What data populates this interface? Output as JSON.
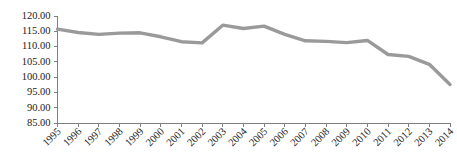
{
  "chart_data": {
    "type": "line",
    "title": "",
    "subtitle": "",
    "xlabel": "",
    "ylabel": "",
    "grid": false,
    "legend": false,
    "legend_position": "none",
    "line_color": "#9a9a9a",
    "axis_color": "#808080",
    "text_color": "#1a1a1a",
    "ylim": [
      85.0,
      120.0
    ],
    "ytick_step": 5.0,
    "ytick_labels": [
      "120.00",
      "115.00",
      "110.00",
      "105.00",
      "100.00",
      "95.00",
      "90.00",
      "85.00"
    ],
    "ytick_values": [
      120.0,
      115.0,
      110.0,
      105.0,
      100.0,
      95.0,
      90.0,
      85.0
    ],
    "categories": [
      "1995",
      "1996",
      "1997",
      "1998",
      "1999",
      "2000",
      "2001",
      "2002",
      "2003",
      "2004",
      "2005",
      "2006",
      "2007",
      "2008",
      "2009",
      "2010",
      "2011",
      "2012",
      "2013",
      "2014"
    ],
    "series": [
      {
        "name": "series-1",
        "values": [
          115.7,
          114.6,
          114.0,
          114.4,
          114.5,
          113.2,
          111.6,
          111.2,
          117.0,
          115.9,
          116.7,
          114.0,
          111.9,
          111.7,
          111.3,
          112.0,
          107.4,
          106.8,
          104.2,
          97.6
        ]
      }
    ]
  }
}
